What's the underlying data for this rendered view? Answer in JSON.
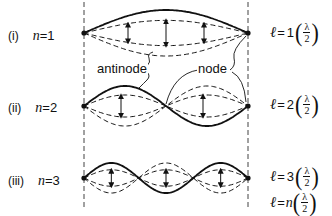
{
  "figure": {
    "colors": {
      "ink": "#111111",
      "background": "#ffffff"
    },
    "boundaries": {
      "left_x": 84,
      "right_x": 248,
      "style": "dashed"
    }
  },
  "modes": [
    {
      "roman": "(i)",
      "n_label": "n",
      "n_eq": "=1",
      "n": 1,
      "y_center": 33,
      "amplitude": 23,
      "formula": {
        "ell": "ℓ",
        "eq": "=",
        "coef": "1",
        "num": "λ",
        "den": "2"
      }
    },
    {
      "roman": "(ii)",
      "n_label": "n",
      "n_eq": "=2",
      "n": 2,
      "y_center": 106,
      "amplitude": 20,
      "formula": {
        "ell": "ℓ",
        "eq": "=",
        "coef": "2",
        "num": "λ",
        "den": "2"
      }
    },
    {
      "roman": "(iii)",
      "n_label": "n",
      "n_eq": "=3",
      "n": 3,
      "y_center": 178,
      "amplitude": 15,
      "formula": {
        "ell": "ℓ",
        "eq": "=",
        "coef": "3",
        "num": "λ",
        "den": "2"
      }
    }
  ],
  "general_formula": {
    "ell": "ℓ",
    "eq": "=",
    "coef": "n",
    "num": "λ",
    "den": "2"
  },
  "annotations": {
    "antinode": "antinode",
    "node": "node"
  }
}
